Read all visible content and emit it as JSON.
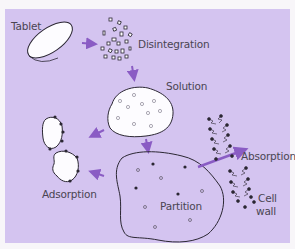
{
  "labels": {
    "tablet": "Tablet",
    "disintegration": "Disintegration",
    "solution": "Solution",
    "adsorption": "Adsorption",
    "partition": "Partition",
    "absorption": "Absorption",
    "cell_wall_line1": "Cell",
    "cell_wall_line2": "wall"
  },
  "colors": {
    "background": "#d4c4f0",
    "arrow": "#8a5cc4",
    "outline": "#2b2733",
    "fill": "#fdfcff",
    "text": "#4a4452"
  }
}
